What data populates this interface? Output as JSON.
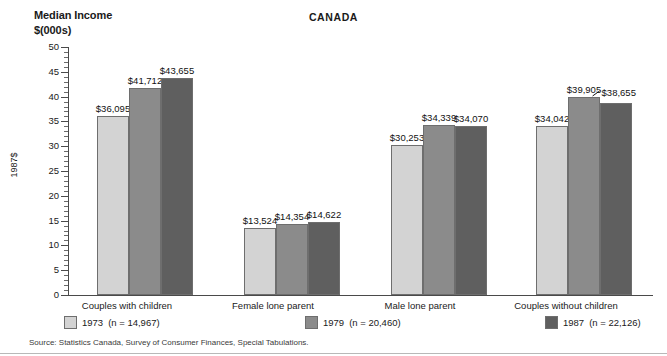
{
  "header": {
    "y_axis_caption_line1": "Median Income",
    "y_axis_caption_line2": "$(000s)",
    "title": "CANADA"
  },
  "source": {
    "text": "Source: Statistics Canada, Survey of Consumer Finances, Special Tabulations."
  },
  "legend": {
    "items": [
      {
        "label": "1973",
        "n": "(n = 14,967)",
        "color": "#d3d3d3"
      },
      {
        "label": "1979",
        "n": "(n = 20,460)",
        "color": "#8b8b8b"
      },
      {
        "label": "1987",
        "n": "(n = 22,126)",
        "color": "#5f5f5f"
      }
    ]
  },
  "chart_data": {
    "type": "bar",
    "title": "CANADA",
    "xlabel": "",
    "ylabel": "1987$",
    "ylim": [
      0,
      50
    ],
    "ytick_labels": [
      "0",
      "5",
      "10",
      "15",
      "20",
      "25",
      "30",
      "35",
      "40",
      "45",
      "50"
    ],
    "ytick_values": [
      0,
      5,
      10,
      15,
      20,
      25,
      30,
      35,
      40,
      45,
      50
    ],
    "minor_tick_step": 1,
    "grid": false,
    "legend_position": "bottom",
    "categories": [
      "Couples with children",
      "Female lone parent",
      "Male lone parent",
      "Couples without children"
    ],
    "series": [
      {
        "name": "1973",
        "color": "#d3d3d3",
        "values": [
          36095,
          13524,
          30253,
          34042
        ],
        "labels": [
          "$36,095",
          "$13,524",
          "$30,253",
          "$34,042"
        ]
      },
      {
        "name": "1979",
        "color": "#8b8b8b",
        "values": [
          41712,
          14354,
          34339,
          39905
        ],
        "labels": [
          "$41,712",
          "$14,354",
          "$34,339",
          "$39,905"
        ]
      },
      {
        "name": "1987",
        "color": "#5f5f5f",
        "values": [
          43655,
          14622,
          34070,
          38655
        ],
        "labels": [
          "$43,655",
          "$14,622",
          "$34,070",
          "$38,655"
        ]
      }
    ],
    "value_units": "dollars (1987 constant)",
    "axis_units": "thousands of dollars"
  }
}
